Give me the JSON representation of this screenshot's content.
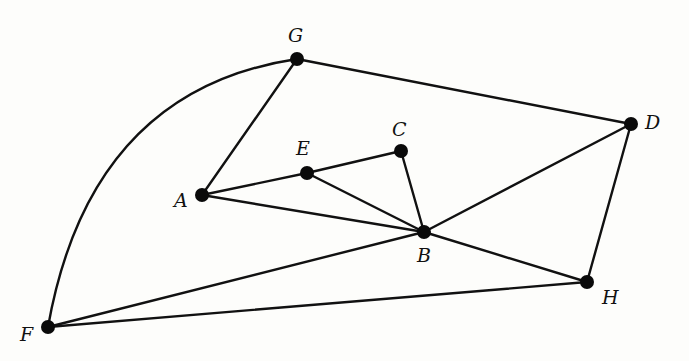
{
  "diagram": {
    "type": "undirected-graph",
    "colors": {
      "edge": "#111111",
      "node": "#0a0a0a",
      "background": "#fdfdfb"
    },
    "nodes": [
      {
        "id": "G",
        "label": "G",
        "x": 297,
        "y": 59,
        "lx": 288,
        "ly": 42
      },
      {
        "id": "D",
        "label": "D",
        "x": 631,
        "y": 124,
        "lx": 645,
        "ly": 129
      },
      {
        "id": "C",
        "label": "C",
        "x": 401,
        "y": 151,
        "lx": 392,
        "ly": 136
      },
      {
        "id": "E",
        "label": "E",
        "x": 307,
        "y": 173,
        "lx": 296,
        "ly": 155
      },
      {
        "id": "A",
        "label": "A",
        "x": 202,
        "y": 195,
        "lx": 174,
        "ly": 207
      },
      {
        "id": "B",
        "label": "B",
        "x": 424,
        "y": 232,
        "lx": 417,
        "ly": 262
      },
      {
        "id": "H",
        "label": "H",
        "x": 587,
        "y": 282,
        "lx": 602,
        "ly": 304
      },
      {
        "id": "F",
        "label": "F",
        "x": 48,
        "y": 327,
        "lx": 20,
        "ly": 341
      }
    ],
    "edges": [
      {
        "from": "G",
        "to": "A"
      },
      {
        "from": "G",
        "to": "D"
      },
      {
        "from": "G",
        "to": "F",
        "curved": true
      },
      {
        "from": "A",
        "to": "E"
      },
      {
        "from": "E",
        "to": "C"
      },
      {
        "from": "C",
        "to": "B"
      },
      {
        "from": "E",
        "to": "B"
      },
      {
        "from": "A",
        "to": "B"
      },
      {
        "from": "B",
        "to": "D"
      },
      {
        "from": "B",
        "to": "H"
      },
      {
        "from": "B",
        "to": "F"
      },
      {
        "from": "D",
        "to": "H"
      },
      {
        "from": "F",
        "to": "H"
      }
    ]
  }
}
